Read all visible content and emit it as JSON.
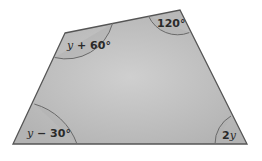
{
  "diagram": {
    "type": "quadrilateral",
    "fill_color": "#bdbdbd",
    "edge_color": "#555555",
    "arc_color": "#6a6a6a",
    "vertices": [
      {
        "id": "top-left",
        "x": 65,
        "y": 33
      },
      {
        "id": "top-right",
        "x": 180,
        "y": 10
      },
      {
        "id": "bottom-right",
        "x": 247,
        "y": 144
      },
      {
        "id": "bottom-left",
        "x": 13,
        "y": 144
      }
    ],
    "angles": {
      "top_left": {
        "var": "y",
        "rest": " + 60°"
      },
      "top_right": {
        "value": "120°"
      },
      "bottom_left": {
        "var": "y",
        "rest": " − 30°"
      },
      "bottom_right": {
        "coef": "2",
        "var": "y"
      }
    }
  }
}
